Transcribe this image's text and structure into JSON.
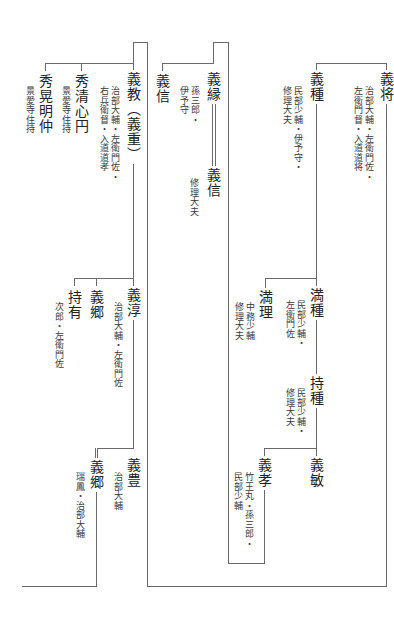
{
  "diagram": {
    "type": "genealogy",
    "orientation": "vertical-rl",
    "persons": {
      "yoshimasa": {
        "name": "義将",
        "notes": "治部大輔・左衛門佐・\n左衛門督・入道道将"
      },
      "yoshitane": {
        "name": "義種",
        "notes": "民部少輔・伊予守・\n修理大夫"
      },
      "yoshiyori": {
        "name": "義縁",
        "notes": "孫三郎・\n伊予守"
      },
      "yoshinobu_a": {
        "name": "義信",
        "notes": ""
      },
      "yoshinobu_b": {
        "name": "義信",
        "notes": "修理大夫"
      },
      "yoshinori": {
        "name": "義教（義重）",
        "notes": "治部大輔・左衛門佐・\n右兵衛督・入道道孝"
      },
      "shusei": {
        "name": "秀清心円",
        "notes": "景愛寺住持"
      },
      "shuko": {
        "name": "秀晃明仲",
        "notes": "景愛寺住持"
      },
      "mitsutane": {
        "name": "満種",
        "notes": "民部少輔・\n左衛門佐"
      },
      "mitsumasa": {
        "name": "満理",
        "notes": "中務少輔\n修理大夫"
      },
      "mochitane": {
        "name": "持種",
        "notes": "民部少輔・\n修理大夫"
      },
      "yoshitoshi": {
        "name": "義敏",
        "notes": ""
      },
      "yoshitaka": {
        "name": "義孝",
        "notes": "竹王丸・孫三郎・\n民部少輔"
      },
      "yoshiatsu": {
        "name": "義淳",
        "notes": "治部大輔・左衛門佐"
      },
      "yoshisato_a": {
        "name": "義郷",
        "notes": ""
      },
      "mochiari": {
        "name": "持有",
        "notes": "次郎・左衛門佐"
      },
      "yoshitoyo": {
        "name": "義豊",
        "notes": "治部大輔"
      },
      "yoshisato_b": {
        "name": "義郷",
        "notes": "瑞鳳・治部大輔"
      }
    },
    "relations": [
      {
        "parent": "義将",
        "children": [
          "義種",
          "義縁",
          "義教"
        ]
      },
      {
        "parent": "義種",
        "children": [
          "満種",
          "満理"
        ]
      },
      {
        "parent": "義縁",
        "children": [
          "義信"
        ]
      },
      {
        "parent": "義縁",
        "adopted": [
          "義信"
        ]
      },
      {
        "parent": "義教",
        "children": [
          "秀清心円",
          "秀晃明仲"
        ]
      },
      {
        "parent": "満種",
        "children": [
          "持種"
        ]
      },
      {
        "parent": "持種",
        "children": [
          "義敏",
          "義孝"
        ]
      },
      {
        "parent": "義教",
        "children": [
          "義淳"
        ]
      },
      {
        "parent": "義淳",
        "children": [
          "義郷",
          "持有",
          "義豊"
        ]
      },
      {
        "parent": "義豊",
        "adopted": [
          "義郷"
        ]
      }
    ]
  }
}
